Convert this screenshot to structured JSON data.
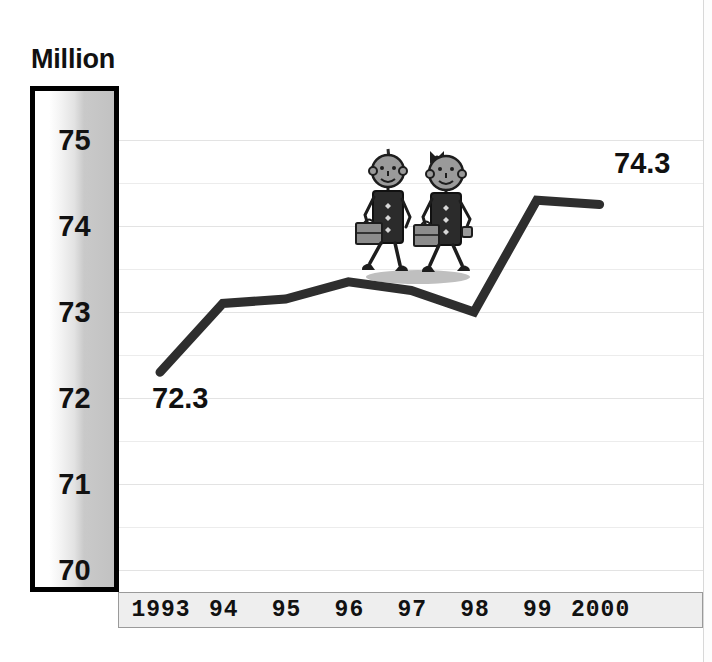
{
  "chart_data": {
    "type": "line",
    "title": "",
    "ylabel": "Million",
    "xlabel": "",
    "categories": [
      "1993",
      "94",
      "95",
      "96",
      "97",
      "98",
      "99",
      "2000"
    ],
    "values": [
      72.3,
      73.1,
      73.15,
      73.35,
      73.25,
      73.0,
      74.3,
      74.25
    ],
    "series": [
      {
        "name": "Million",
        "values": [
          72.3,
          73.1,
          73.15,
          73.35,
          73.25,
          73.0,
          74.3,
          74.25
        ]
      }
    ],
    "ylim": [
      70,
      75
    ],
    "yticks": [
      70,
      71,
      72,
      73,
      74,
      75
    ],
    "gridline_interval": 0.5,
    "grid": true,
    "legend": "none",
    "point_labels": [
      {
        "category": "1993",
        "value": 72.3,
        "text": "72.3"
      },
      {
        "category": "99",
        "value": 74.3,
        "text": "74.3"
      }
    ],
    "line_color": "#2e2e2e",
    "line_width": 9
  },
  "axis": {
    "title": "Million",
    "y_ticks": [
      "75",
      "74",
      "73",
      "72",
      "71",
      "70"
    ],
    "x_ticks": [
      "1993",
      "94",
      "95",
      "96",
      "97",
      "98",
      "99",
      "2000"
    ]
  },
  "annotations": {
    "start_label": "72.3",
    "end_label": "74.3"
  },
  "illustration": {
    "name": "two-walking-business-people",
    "skin_color": "#9a9a9a",
    "suit_color": "#2b2b2b",
    "briefcase_color": "#8c8c8c",
    "shadow_color": "#7c7c7c"
  },
  "colors": {
    "line": "#2e2e2e",
    "grid": "#ececec",
    "axis_border": "#000000",
    "strip_background": "#eeeeee",
    "text": "#111111"
  }
}
